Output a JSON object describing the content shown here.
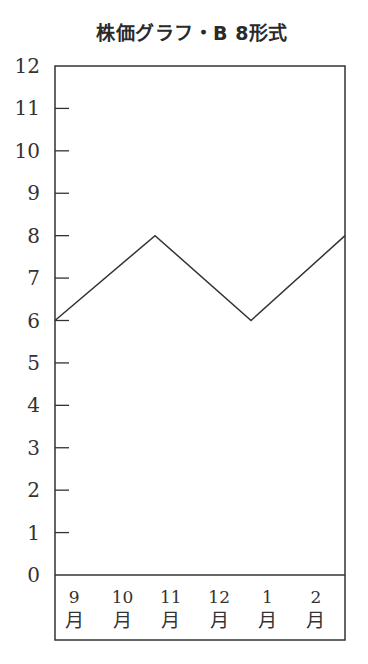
{
  "title": "株価グラフ・B 8形式",
  "chart_data": {
    "type": "line",
    "title": "株価グラフ・B 8形式",
    "xlabel": "",
    "ylabel": "",
    "ylim": [
      0,
      12
    ],
    "yticks": [
      0,
      1,
      2,
      3,
      4,
      5,
      6,
      7,
      8,
      9,
      10,
      11,
      12
    ],
    "categories": [
      "9月",
      "10月",
      "11月",
      "12月",
      "1月",
      "2月"
    ],
    "category_labels": [
      {
        "num": "9",
        "unit": "月"
      },
      {
        "num": "10",
        "unit": "月"
      },
      {
        "num": "11",
        "unit": "月"
      },
      {
        "num": "12",
        "unit": "月"
      },
      {
        "num": "1",
        "unit": "月"
      },
      {
        "num": "2",
        "unit": "月"
      }
    ],
    "series": [
      {
        "name": "株価",
        "points": [
          {
            "x_position": 0.0,
            "y": 6
          },
          {
            "x_position": 0.345,
            "y": 8
          },
          {
            "x_position": 0.676,
            "y": 6
          },
          {
            "x_position": 1.0,
            "y": 8
          }
        ]
      }
    ],
    "grid": false,
    "legend": null,
    "colors": {
      "line": "#333333",
      "frame": "#333333",
      "text": "#333333"
    }
  }
}
